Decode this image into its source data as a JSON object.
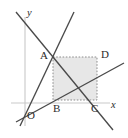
{
  "figure": {
    "kind": "coordinate-geometry-diagram",
    "width": 128,
    "height": 138,
    "background": "#ffffff",
    "axis_color": "#c9c9c9",
    "line_color": "#4a4a4a",
    "rect_fill_color": "#e3e3e3",
    "rect_dash_color": "#8d8d8d",
    "label_color": "#2b2b2b"
  },
  "axes": {
    "origin": {
      "x": 25,
      "y": 103
    },
    "x_axis": {
      "x1": 11,
      "y1": 103,
      "x2": 110,
      "y2": 103
    },
    "y_axis": {
      "x1": 25,
      "y1": 17,
      "x2": 25,
      "y2": 126
    },
    "labels": {
      "x": "x",
      "y": "y",
      "origin": "O"
    },
    "label_positions": {
      "x": {
        "left": 111,
        "top": 100
      },
      "y": {
        "left": 27,
        "top": 8
      },
      "origin": {
        "left": 27,
        "top": 110
      }
    }
  },
  "points": {
    "A": {
      "x": 53,
      "y": 57,
      "label": "A",
      "label_left": 40,
      "label_top": 50
    },
    "B": {
      "x": 53,
      "y": 100,
      "label": "B",
      "label_left": 53,
      "label_top": 103
    },
    "C": {
      "x": 97,
      "y": 100,
      "label": "C",
      "label_left": 91,
      "label_top": 103
    },
    "D": {
      "x": 97,
      "y": 57,
      "label": "D",
      "label_left": 101,
      "label_top": 49
    }
  },
  "rectangle": {
    "name": "ABCD",
    "left": 53,
    "top": 57,
    "right": 97,
    "bottom": 100,
    "style": "dashed outline, light gray fill"
  },
  "lines": [
    {
      "id": "line-descending",
      "description": "negative-slope line through A and C extending past both",
      "x1": 16,
      "y1": 12,
      "x2": 113,
      "y2": 130
    },
    {
      "id": "line-steep-ascending",
      "description": "steep positive-slope line through origin region and A, rising to upper right",
      "x1": 20,
      "y1": 126,
      "x2": 74,
      "y2": 12
    },
    {
      "id": "line-gentle-ascending",
      "description": "gentle positive-slope line through origin rising to the right past the rectangle",
      "x1": 16,
      "y1": 122,
      "x2": 124,
      "y2": 63
    }
  ]
}
